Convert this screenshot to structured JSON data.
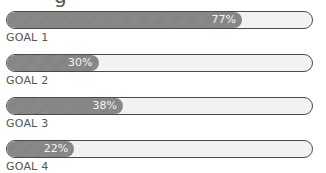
{
  "title_fragment": "g",
  "colors": {
    "fill": "#888888",
    "track": "#f2f2f2",
    "outline": "#4a4a4a",
    "label": "#555555",
    "pct_text": "#f4f4f4"
  },
  "chart_data": {
    "type": "bar",
    "orientation": "horizontal",
    "title": "",
    "categories": [
      "GOAL 1",
      "GOAL 2",
      "GOAL 3",
      "GOAL 4"
    ],
    "values": [
      77,
      30,
      38,
      22
    ],
    "value_labels": [
      "77%",
      "30%",
      "38%",
      "22%"
    ],
    "xlim": [
      0,
      100
    ],
    "unit": "%"
  },
  "goals": [
    {
      "label": "GOAL 1",
      "value": 77,
      "pct_label": "77%"
    },
    {
      "label": "GOAL 2",
      "value": 30,
      "pct_label": "30%"
    },
    {
      "label": "GOAL 3",
      "value": 38,
      "pct_label": "38%"
    },
    {
      "label": "GOAL 4",
      "value": 22,
      "pct_label": "22%"
    }
  ]
}
